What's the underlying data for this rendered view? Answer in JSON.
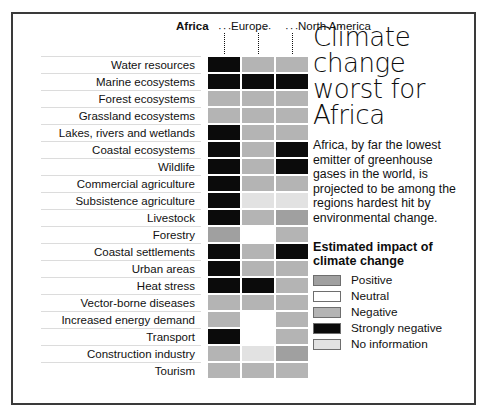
{
  "headline": "Climate change worst for Africa",
  "blurb": "Africa, by far the lowest emitter of greenhouse gases in the world, is projected to be among the regions hardest hit by environmental change.",
  "legend": {
    "title": "Estimated impact of climate change",
    "items": [
      {
        "label": "Positive",
        "key": "pos",
        "color": "#a0a0a0"
      },
      {
        "label": "Neutral",
        "key": "neutral",
        "color": "#ffffff"
      },
      {
        "label": "Negative",
        "key": "neg",
        "color": "#b4b4b4"
      },
      {
        "label": "Strongly negative",
        "key": "strongneg",
        "color": "#0b0b0b"
      },
      {
        "label": "No information",
        "key": "noinfo",
        "color": "#e2e2e2"
      }
    ]
  },
  "chart_data": {
    "type": "heatmap",
    "title": "Climate change worst for Africa",
    "xlabel": "",
    "ylabel": "",
    "legend_position": "right",
    "grid": false,
    "columns": [
      "Africa",
      "Europe",
      "North America"
    ],
    "column_emphasis": [
      "bold",
      "normal",
      "normal"
    ],
    "categories": [
      "Water resources",
      "Marine ecosystems",
      "Forest ecosystems",
      "Grassland ecosystems",
      "Lakes, rivers and wetlands",
      "Coastal ecosystems",
      "Wildlife",
      "Commercial agriculture",
      "Subsistence agriculture",
      "Livestock",
      "Forestry",
      "Coastal settlements",
      "Urban areas",
      "Heat stress",
      "Vector-borne diseases",
      "Increased energy demand",
      "Transport",
      "Construction industry",
      "Tourism"
    ],
    "value_scale": [
      "pos",
      "neutral",
      "neg",
      "strongneg",
      "noinfo"
    ],
    "value_labels": {
      "pos": "Positive",
      "neutral": "Neutral",
      "neg": "Negative",
      "strongneg": "Strongly negative",
      "noinfo": "No information"
    },
    "values": [
      [
        "strongneg",
        "neg",
        "neg"
      ],
      [
        "strongneg",
        "strongneg",
        "strongneg"
      ],
      [
        "neg",
        "neg",
        "neg"
      ],
      [
        "neg",
        "neg",
        "neg"
      ],
      [
        "strongneg",
        "neg",
        "neg"
      ],
      [
        "strongneg",
        "neg",
        "strongneg"
      ],
      [
        "strongneg",
        "neg",
        "strongneg"
      ],
      [
        "strongneg",
        "neg",
        "neg"
      ],
      [
        "strongneg",
        "noinfo",
        "noinfo"
      ],
      [
        "strongneg",
        "neg",
        "pos"
      ],
      [
        "pos",
        "neutral",
        "neg"
      ],
      [
        "strongneg",
        "neg",
        "strongneg"
      ],
      [
        "strongneg",
        "neg",
        "neg"
      ],
      [
        "strongneg",
        "strongneg",
        "neg"
      ],
      [
        "neg",
        "neg",
        "neg"
      ],
      [
        "neg",
        "neutral",
        "neg"
      ],
      [
        "strongneg",
        "neutral",
        "neg"
      ],
      [
        "neg",
        "noinfo",
        "pos"
      ],
      [
        "neg",
        "neg",
        "neg"
      ]
    ]
  }
}
